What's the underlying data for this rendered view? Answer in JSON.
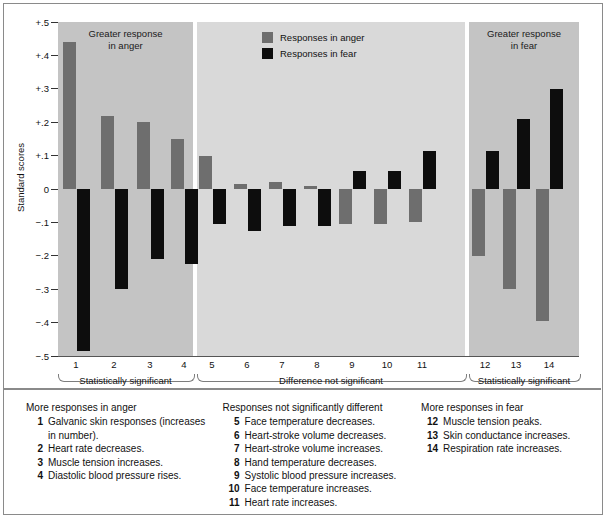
{
  "figure": {
    "y_axis_title": "Standard scores",
    "y_ticks": [
      "+.5",
      "+.4",
      "+.3",
      "+.2",
      "+.1",
      "0",
      "−.1",
      "−.2",
      "−.3",
      "−.4",
      "−.5"
    ],
    "panel_captions": {
      "left": "Greater response\nin anger",
      "right": "Greater response\nin fear"
    },
    "legend": [
      {
        "label": "Responses in anger",
        "color": "#6e6e6e",
        "key": "anger"
      },
      {
        "label": "Responses in fear",
        "color": "#0d0d0d",
        "key": "fear"
      }
    ],
    "group_braces": [
      {
        "label": "Statistically significant"
      },
      {
        "label": "Difference not significant"
      },
      {
        "label": "Statistically significant"
      }
    ]
  },
  "chart_data": {
    "type": "bar",
    "title": "",
    "xlabel": "",
    "ylabel": "Standard scores",
    "ylim": [
      -0.5,
      0.5
    ],
    "grid": false,
    "legend_position": "top-center",
    "categories": [
      "1",
      "2",
      "3",
      "4",
      "5",
      "6",
      "7",
      "8",
      "9",
      "10",
      "11",
      "12",
      "13",
      "14"
    ],
    "series": [
      {
        "name": "Responses in anger",
        "color": "#6e6e6e",
        "values": [
          0.44,
          0.22,
          0.2,
          0.15,
          0.1,
          0.015,
          0.02,
          0.01,
          -0.105,
          -0.105,
          -0.1,
          -0.2,
          -0.3,
          -0.395
        ]
      },
      {
        "name": "Responses in fear",
        "color": "#0d0d0d",
        "values": [
          -0.485,
          -0.3,
          -0.21,
          -0.225,
          -0.105,
          -0.125,
          -0.11,
          -0.11,
          0.055,
          0.055,
          0.115,
          0.115,
          0.21,
          0.3
        ]
      }
    ],
    "groups": [
      {
        "label": "Statistically significant",
        "categories": [
          "1",
          "2",
          "3",
          "4"
        ],
        "note": "Greater response in anger"
      },
      {
        "label": "Difference not significant",
        "categories": [
          "5",
          "6",
          "7",
          "8",
          "9",
          "10",
          "11"
        ],
        "note": ""
      },
      {
        "label": "Statistically significant",
        "categories": [
          "12",
          "13",
          "14"
        ],
        "note": "Greater response in fear"
      }
    ]
  },
  "caption": {
    "columns": [
      {
        "heading": "More responses in anger",
        "items": [
          {
            "num": "1",
            "text": "Galvanic skin responses (increases in number)."
          },
          {
            "num": "2",
            "text": "Heart rate decreases."
          },
          {
            "num": "3",
            "text": "Muscle tension increases."
          },
          {
            "num": "4",
            "text": "Diastolic blood pressure rises."
          }
        ]
      },
      {
        "heading": "Responses not significantly different",
        "items": [
          {
            "num": "5",
            "text": "Face temperature decreases."
          },
          {
            "num": "6",
            "text": "Heart-stroke volume decreases."
          },
          {
            "num": "7",
            "text": "Heart-stroke volume increases."
          },
          {
            "num": "8",
            "text": "Hand temperature decreases."
          },
          {
            "num": "9",
            "text": "Systolic blood pressure increases."
          },
          {
            "num": "10",
            "text": "Face temperature increases."
          },
          {
            "num": "11",
            "text": "Heart rate increases."
          }
        ]
      },
      {
        "heading": "More responses in fear",
        "items": [
          {
            "num": "12",
            "text": "Muscle tension peaks."
          },
          {
            "num": "13",
            "text": "Skin conductance increases."
          },
          {
            "num": "14",
            "text": "Respiration rate increases."
          }
        ]
      }
    ]
  }
}
